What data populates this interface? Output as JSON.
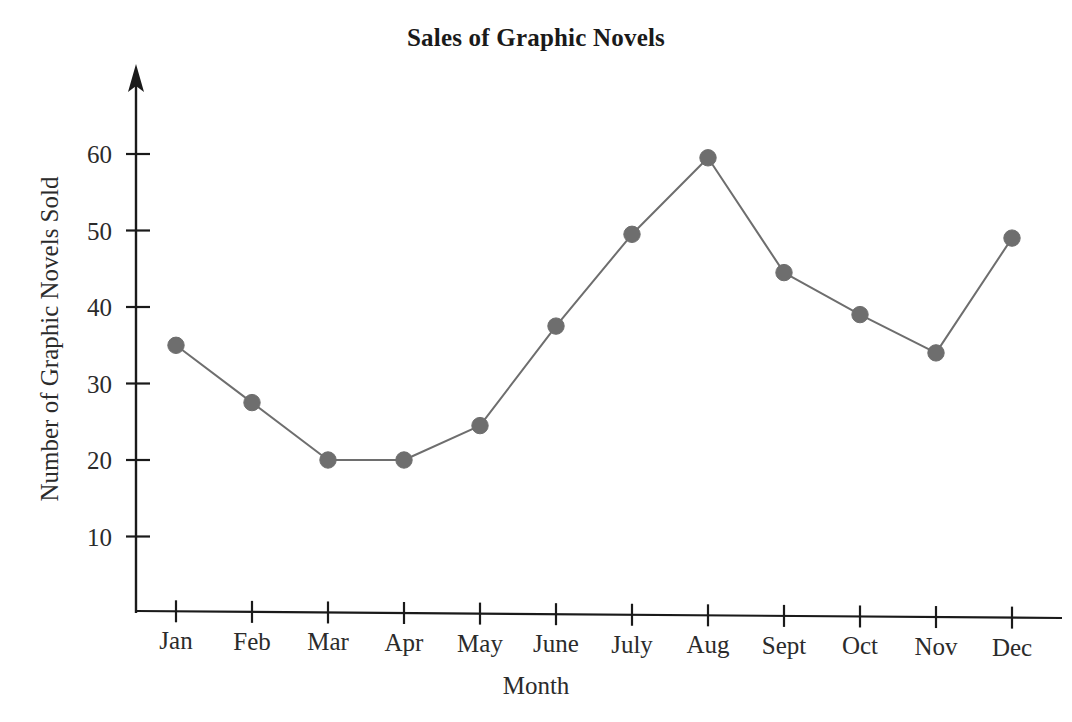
{
  "chart_data": {
    "type": "line",
    "title": "Sales of Graphic Novels",
    "xlabel": "Month",
    "ylabel": "Number of Graphic Novels Sold",
    "categories": [
      "Jan",
      "Feb",
      "Mar",
      "Apr",
      "May",
      "June",
      "July",
      "Aug",
      "Sept",
      "Oct",
      "Nov",
      "Dec"
    ],
    "values": [
      35,
      27.5,
      20,
      20,
      24.5,
      37.5,
      49.5,
      59.5,
      44.5,
      39,
      34,
      49
    ],
    "ytick_labels": [
      "10",
      "20",
      "30",
      "40",
      "50",
      "60"
    ],
    "yticks": [
      10,
      20,
      30,
      40,
      50,
      60
    ],
    "ylim": [
      0,
      68
    ],
    "xlim": [
      0,
      13
    ],
    "grid": false,
    "legend": false,
    "marker": "filled-circle",
    "line_color": "#6e6e6e",
    "marker_color": "#6e6e6e",
    "axis_color": "#1a1a1a",
    "background": "#ffffff",
    "y_axis_arrow": true
  },
  "axis": {
    "y_label_text": "Number of Graphic Novels Sold",
    "x_label_text": "Month"
  },
  "title": {
    "text": "Sales of Graphic Novels"
  },
  "ticks": {
    "y": [
      {
        "label": "10"
      },
      {
        "label": "20"
      },
      {
        "label": "30"
      },
      {
        "label": "40"
      },
      {
        "label": "50"
      },
      {
        "label": "60"
      }
    ],
    "x": [
      {
        "label": "Jan"
      },
      {
        "label": "Feb"
      },
      {
        "label": "Mar"
      },
      {
        "label": "Apr"
      },
      {
        "label": "May"
      },
      {
        "label": "June"
      },
      {
        "label": "July"
      },
      {
        "label": "Aug"
      },
      {
        "label": "Sept"
      },
      {
        "label": "Oct"
      },
      {
        "label": "Nov"
      },
      {
        "label": "Dec"
      }
    ]
  }
}
